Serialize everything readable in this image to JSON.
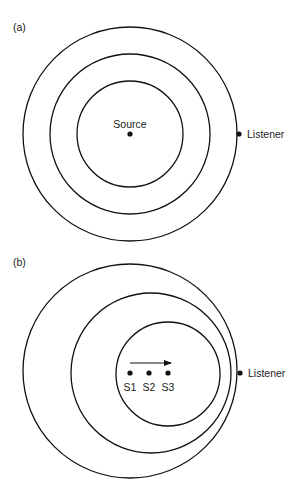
{
  "panel_a": {
    "label": "(a)",
    "source_label": "Source",
    "listener_label": "Listener",
    "center": [
      130,
      134
    ],
    "rings": [
      {
        "cx": 130,
        "cy": 134,
        "r": 53
      },
      {
        "cx": 130,
        "cy": 134,
        "r": 80
      },
      {
        "cx": 130,
        "cy": 134,
        "r": 107
      }
    ],
    "listener": [
      239,
      134
    ]
  },
  "panel_b": {
    "label": "(b)",
    "listener_label": "Listener",
    "sources": [
      {
        "label": "S1",
        "x": 130,
        "y": 373
      },
      {
        "label": "S2",
        "x": 149,
        "y": 373
      },
      {
        "label": "S3",
        "x": 168,
        "y": 373
      }
    ],
    "rings": [
      {
        "cx": 130,
        "cy": 371,
        "r": 107
      },
      {
        "cx": 151,
        "cy": 373,
        "r": 80
      },
      {
        "cx": 168,
        "cy": 374,
        "r": 52
      }
    ],
    "arrow": {
      "x1": 130,
      "x2": 171,
      "y": 363
    },
    "listener": [
      240,
      373
    ]
  },
  "colors": {
    "line": "#111111",
    "text": "#222222",
    "background": "#ffffff"
  }
}
